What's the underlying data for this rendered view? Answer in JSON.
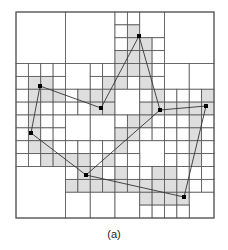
{
  "figure": {
    "caption": "(a)",
    "type": "quadtree",
    "grid_units": 16,
    "colors": {
      "line": "#555555",
      "shade": "#dedede",
      "edge": "#333333",
      "point": "#000000",
      "background": "#ffffff"
    },
    "cells": [
      [
        0,
        0,
        4,
        4,
        0
      ],
      [
        4,
        0,
        4,
        4,
        0
      ],
      [
        12,
        0,
        4,
        4,
        0
      ],
      [
        8,
        0,
        1,
        1,
        0
      ],
      [
        9,
        0,
        1,
        1,
        0
      ],
      [
        8,
        1,
        1,
        1,
        0
      ],
      [
        9,
        1,
        1,
        1,
        1
      ],
      [
        10,
        0,
        2,
        2,
        0
      ],
      [
        8,
        2,
        1,
        1,
        0
      ],
      [
        9,
        2,
        1,
        1,
        1
      ],
      [
        8,
        3,
        1,
        1,
        1
      ],
      [
        9,
        3,
        1,
        1,
        1
      ],
      [
        10,
        2,
        1,
        1,
        1
      ],
      [
        11,
        2,
        1,
        1,
        0
      ],
      [
        10,
        3,
        1,
        1,
        1
      ],
      [
        11,
        3,
        1,
        1,
        0
      ],
      [
        0,
        4,
        1,
        1,
        0
      ],
      [
        1,
        4,
        1,
        1,
        0
      ],
      [
        2,
        4,
        1,
        1,
        0
      ],
      [
        3,
        4,
        1,
        1,
        0
      ],
      [
        0,
        5,
        1,
        1,
        0
      ],
      [
        1,
        5,
        1,
        1,
        1
      ],
      [
        2,
        5,
        1,
        1,
        1
      ],
      [
        3,
        5,
        1,
        1,
        0
      ],
      [
        0,
        6,
        1,
        1,
        0
      ],
      [
        1,
        6,
        1,
        1,
        1
      ],
      [
        2,
        6,
        1,
        1,
        1
      ],
      [
        3,
        6,
        1,
        1,
        1
      ],
      [
        0,
        7,
        1,
        1,
        0
      ],
      [
        1,
        7,
        1,
        1,
        1
      ],
      [
        2,
        7,
        1,
        1,
        0
      ],
      [
        3,
        7,
        1,
        1,
        0
      ],
      [
        4,
        4,
        2,
        2,
        0
      ],
      [
        6,
        4,
        1,
        1,
        0
      ],
      [
        7,
        4,
        1,
        1,
        0
      ],
      [
        6,
        5,
        1,
        1,
        0
      ],
      [
        7,
        5,
        1,
        1,
        1
      ],
      [
        4,
        6,
        1,
        1,
        0
      ],
      [
        5,
        6,
        1,
        1,
        1
      ],
      [
        6,
        6,
        1,
        1,
        1
      ],
      [
        7,
        6,
        1,
        1,
        1
      ],
      [
        4,
        7,
        1,
        1,
        0
      ],
      [
        5,
        7,
        1,
        1,
        0
      ],
      [
        6,
        7,
        1,
        1,
        1
      ],
      [
        7,
        7,
        1,
        1,
        1
      ],
      [
        8,
        4,
        1,
        1,
        1
      ],
      [
        9,
        4,
        1,
        1,
        1
      ],
      [
        10,
        4,
        1,
        1,
        1
      ],
      [
        11,
        4,
        1,
        1,
        0
      ],
      [
        8,
        5,
        1,
        1,
        1
      ],
      [
        9,
        5,
        1,
        1,
        0
      ],
      [
        10,
        5,
        1,
        1,
        1
      ],
      [
        11,
        5,
        1,
        1,
        0
      ],
      [
        8,
        6,
        2,
        2,
        0
      ],
      [
        10,
        6,
        1,
        1,
        0
      ],
      [
        11,
        6,
        1,
        1,
        1
      ],
      [
        10,
        7,
        1,
        1,
        1
      ],
      [
        11,
        7,
        1,
        1,
        1
      ],
      [
        12,
        4,
        2,
        2,
        0
      ],
      [
        14,
        4,
        2,
        2,
        0
      ],
      [
        12,
        6,
        1,
        1,
        0
      ],
      [
        13,
        6,
        1,
        1,
        0
      ],
      [
        14,
        6,
        1,
        1,
        0
      ],
      [
        15,
        6,
        1,
        1,
        1
      ],
      [
        12,
        7,
        1,
        1,
        1
      ],
      [
        13,
        7,
        1,
        1,
        1
      ],
      [
        14,
        7,
        1,
        1,
        1
      ],
      [
        15,
        7,
        1,
        1,
        1
      ],
      [
        0,
        8,
        1,
        1,
        0
      ],
      [
        1,
        8,
        1,
        1,
        1
      ],
      [
        2,
        8,
        1,
        1,
        0
      ],
      [
        3,
        8,
        1,
        1,
        0
      ],
      [
        0,
        9,
        1,
        1,
        0
      ],
      [
        1,
        9,
        1,
        1,
        1
      ],
      [
        2,
        9,
        1,
        1,
        0
      ],
      [
        3,
        9,
        1,
        1,
        0
      ],
      [
        0,
        10,
        1,
        1,
        0
      ],
      [
        1,
        10,
        1,
        1,
        1
      ],
      [
        2,
        10,
        1,
        1,
        1
      ],
      [
        3,
        10,
        1,
        1,
        0
      ],
      [
        0,
        11,
        1,
        1,
        0
      ],
      [
        1,
        11,
        1,
        1,
        0
      ],
      [
        2,
        11,
        1,
        1,
        1
      ],
      [
        3,
        11,
        1,
        1,
        1
      ],
      [
        4,
        8,
        2,
        2,
        0
      ],
      [
        6,
        8,
        2,
        2,
        0
      ],
      [
        4,
        10,
        1,
        1,
        0
      ],
      [
        5,
        10,
        1,
        1,
        0
      ],
      [
        6,
        10,
        1,
        1,
        0
      ],
      [
        7,
        10,
        1,
        1,
        0
      ],
      [
        4,
        11,
        1,
        1,
        1
      ],
      [
        5,
        11,
        1,
        1,
        1
      ],
      [
        6,
        11,
        1,
        1,
        0
      ],
      [
        7,
        11,
        1,
        1,
        1
      ],
      [
        8,
        8,
        1,
        1,
        0
      ],
      [
        9,
        8,
        1,
        1,
        1
      ],
      [
        10,
        8,
        1,
        1,
        1
      ],
      [
        11,
        8,
        1,
        1,
        0
      ],
      [
        8,
        9,
        1,
        1,
        1
      ],
      [
        9,
        9,
        1,
        1,
        1
      ],
      [
        10,
        9,
        1,
        1,
        0
      ],
      [
        11,
        9,
        1,
        1,
        0
      ],
      [
        8,
        10,
        1,
        1,
        1
      ],
      [
        9,
        10,
        1,
        1,
        0
      ],
      [
        10,
        10,
        2,
        2,
        0
      ],
      [
        8,
        11,
        1,
        1,
        0
      ],
      [
        9,
        11,
        1,
        1,
        0
      ],
      [
        12,
        8,
        1,
        1,
        0
      ],
      [
        13,
        8,
        1,
        1,
        0
      ],
      [
        14,
        8,
        1,
        1,
        1
      ],
      [
        15,
        8,
        1,
        1,
        0
      ],
      [
        12,
        9,
        1,
        1,
        0
      ],
      [
        13,
        9,
        1,
        1,
        0
      ],
      [
        14,
        9,
        1,
        1,
        1
      ],
      [
        15,
        9,
        1,
        1,
        0
      ],
      [
        12,
        10,
        1,
        1,
        0
      ],
      [
        13,
        10,
        1,
        1,
        0
      ],
      [
        14,
        10,
        1,
        1,
        1
      ],
      [
        15,
        10,
        1,
        1,
        0
      ],
      [
        12,
        11,
        1,
        1,
        0
      ],
      [
        13,
        11,
        1,
        1,
        0
      ],
      [
        14,
        11,
        1,
        1,
        1
      ],
      [
        15,
        11,
        1,
        1,
        0
      ],
      [
        0,
        12,
        4,
        4,
        0
      ],
      [
        4,
        12,
        1,
        1,
        0
      ],
      [
        5,
        12,
        1,
        1,
        1
      ],
      [
        6,
        12,
        1,
        1,
        1
      ],
      [
        7,
        12,
        1,
        1,
        0
      ],
      [
        4,
        13,
        1,
        1,
        1
      ],
      [
        5,
        13,
        1,
        1,
        1
      ],
      [
        6,
        13,
        1,
        1,
        1
      ],
      [
        7,
        13,
        1,
        1,
        1
      ],
      [
        4,
        14,
        2,
        2,
        0
      ],
      [
        6,
        14,
        2,
        2,
        0
      ],
      [
        8,
        12,
        1,
        1,
        1
      ],
      [
        9,
        12,
        1,
        1,
        0
      ],
      [
        10,
        12,
        1,
        1,
        0
      ],
      [
        11,
        12,
        1,
        1,
        1
      ],
      [
        8,
        13,
        1,
        1,
        1
      ],
      [
        9,
        13,
        1,
        1,
        1
      ],
      [
        10,
        13,
        1,
        1,
        1
      ],
      [
        11,
        13,
        1,
        1,
        1
      ],
      [
        8,
        14,
        2,
        2,
        0
      ],
      [
        10,
        14,
        1,
        1,
        1
      ],
      [
        11,
        14,
        1,
        1,
        1
      ],
      [
        10,
        15,
        1,
        1,
        0
      ],
      [
        11,
        15,
        1,
        1,
        0
      ],
      [
        12,
        12,
        1,
        1,
        1
      ],
      [
        13,
        12,
        1,
        1,
        0
      ],
      [
        14,
        12,
        1,
        1,
        0
      ],
      [
        15,
        12,
        1,
        1,
        0
      ],
      [
        12,
        13,
        1,
        1,
        1
      ],
      [
        13,
        13,
        1,
        1,
        1
      ],
      [
        14,
        13,
        1,
        1,
        0
      ],
      [
        15,
        13,
        1,
        1,
        0
      ],
      [
        12,
        14,
        1,
        1,
        1
      ],
      [
        13,
        14,
        1,
        1,
        1
      ],
      [
        14,
        14,
        2,
        2,
        0
      ],
      [
        12,
        15,
        1,
        1,
        0
      ],
      [
        13,
        15,
        1,
        1,
        0
      ]
    ],
    "points": [
      {
        "id": "P1",
        "x": 139,
        "y": 36
      },
      {
        "id": "P2",
        "x": 40,
        "y": 86
      },
      {
        "id": "P3",
        "x": 101,
        "y": 108
      },
      {
        "id": "P4",
        "x": 160,
        "y": 110
      },
      {
        "id": "P5",
        "x": 206,
        "y": 106
      },
      {
        "id": "P6",
        "x": 31,
        "y": 133
      },
      {
        "id": "P7",
        "x": 86,
        "y": 175
      },
      {
        "id": "P8",
        "x": 184,
        "y": 197
      }
    ],
    "edges": [
      [
        "P1",
        "P3"
      ],
      [
        "P1",
        "P4"
      ],
      [
        "P3",
        "P2"
      ],
      [
        "P2",
        "P6"
      ],
      [
        "P6",
        "P7"
      ],
      [
        "P4",
        "P7"
      ],
      [
        "P4",
        "P5"
      ],
      [
        "P5",
        "P8"
      ],
      [
        "P7",
        "P8"
      ]
    ]
  }
}
